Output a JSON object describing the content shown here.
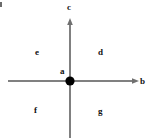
{
  "diagram": {
    "background_color": "#ffffff",
    "axis_color": "#808080",
    "point_color": "#000000",
    "label_color": "#111111",
    "axes": [
      {
        "id": "vertical",
        "label": "c",
        "icon": "arrow-up-icon",
        "x1": 70,
        "y1": 138,
        "x2": 70,
        "y2": 19
      },
      {
        "id": "horizontal",
        "label": "b",
        "icon": "arrow-right-icon",
        "x1": 8,
        "y1": 81,
        "x2": 138,
        "y2": 81
      }
    ],
    "origin": {
      "label": "a",
      "x": 70,
      "y": 81,
      "radius": 4.5
    },
    "regions": [
      {
        "id": "upper-left",
        "label": "e",
        "x": 38,
        "y": 52
      },
      {
        "id": "upper-right",
        "label": "d",
        "x": 101,
        "y": 52
      },
      {
        "id": "lower-left",
        "label": "f",
        "x": 37,
        "y": 111
      },
      {
        "id": "lower-right",
        "label": "g",
        "x": 101,
        "y": 112
      }
    ],
    "labels": {
      "c": "c",
      "b": "b",
      "a": "a",
      "e": "e",
      "d": "d",
      "f": "f",
      "g": "g"
    }
  }
}
